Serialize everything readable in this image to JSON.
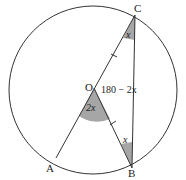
{
  "labels": {
    "A": "A",
    "B": "B",
    "C": "C",
    "O": "O"
  },
  "angles": {
    "at_C": "x",
    "at_B": "x",
    "at_O_central": "2x",
    "at_O_obtuse": "180 − 2x"
  },
  "colors": {
    "line": "#333333",
    "shade": "#a6a6a6"
  }
}
